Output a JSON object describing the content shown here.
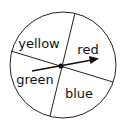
{
  "spinner": {
    "sections": [
      {
        "label": "yellow",
        "x": 39,
        "y": 48
      },
      {
        "label": "red",
        "x": 88,
        "y": 54
      },
      {
        "label": "green",
        "x": 35,
        "y": 84
      },
      {
        "label": "blue",
        "x": 79,
        "y": 98
      }
    ],
    "pointer": {
      "direction": "red"
    }
  }
}
